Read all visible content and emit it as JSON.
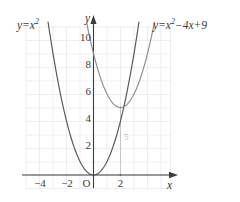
{
  "chart_data": {
    "type": "line",
    "title": "",
    "xlabel": "x",
    "ylabel": "y",
    "xlim": [
      -5.2,
      5.2
    ],
    "ylim": [
      -1.6,
      12.4
    ],
    "grid": true,
    "grid_step": 1,
    "legend": "inline-curve-labels",
    "x_ticks": [
      -4,
      -2,
      2
    ],
    "x_tick_labels": [
      "−4",
      "−2",
      "2"
    ],
    "y_ticks": [
      2,
      4,
      6,
      8,
      10
    ],
    "y_tick_labels": [
      "2",
      "4",
      "6",
      "8",
      "10"
    ],
    "origin_label": "O",
    "series": [
      {
        "name": "y=x^2",
        "label_text": "y=x²",
        "equation": "y = x^2",
        "color": "#555555",
        "vertex": [
          0,
          0
        ],
        "x": [
          -3.45,
          -3.0,
          -2.5,
          -2.0,
          -1.5,
          -1.0,
          -0.5,
          0.0,
          0.5,
          1.0,
          1.5,
          2.0,
          2.5,
          3.0,
          3.45
        ],
        "y": [
          11.9,
          9.0,
          6.25,
          4.0,
          2.25,
          1.0,
          0.25,
          0.0,
          0.25,
          1.0,
          2.25,
          4.0,
          6.25,
          9.0,
          11.9
        ]
      },
      {
        "name": "y=x^2-4x+9",
        "label_text": "y=x²−4x+9",
        "equation": "y = x^2 - 4x + 9",
        "color": "#8c8c8c",
        "vertex": [
          2,
          5
        ],
        "x": [
          -0.45,
          0.0,
          0.5,
          1.0,
          1.5,
          2.0,
          2.5,
          3.0,
          3.5,
          4.0,
          4.45
        ],
        "y": [
          11.0,
          9.0,
          7.25,
          6.0,
          5.25,
          5.0,
          5.25,
          6.0,
          7.25,
          9.0,
          11.0
        ]
      }
    ],
    "annotations": [
      {
        "name": "vertex-drop-line",
        "type": "vertical-segment",
        "x": 2,
        "y_from": 0,
        "y_to": 5,
        "label": "5",
        "color": "#b9b9b9"
      },
      {
        "name": "vertex-marker",
        "type": "point",
        "x": 2,
        "y": 5,
        "color": "#9a9a9a"
      },
      {
        "name": "foot-marker",
        "type": "point",
        "x": 2,
        "y": 0,
        "color": "#9a9a9a"
      }
    ]
  },
  "labels": {
    "left_curve": {
      "prefix": "y=x",
      "exponent": "2"
    },
    "right_curve": {
      "prefix": "y=x",
      "exponent": "2",
      "suffix": "−4x+9"
    },
    "axis_x": "x",
    "axis_y": "y",
    "origin": "O",
    "x_tick_minus4": "−4",
    "x_tick_minus2": "−2",
    "x_tick_2": "2",
    "y_tick_2": "2",
    "y_tick_4": "4",
    "y_tick_6": "6",
    "y_tick_8": "8",
    "y_tick_10": "10",
    "segment_length": "5"
  },
  "colors": {
    "background": "#ffffff",
    "grid": "#e8e4ea",
    "axis": "#3c3c3c",
    "curve_primary": "#555555",
    "curve_secondary": "#8c8c8c",
    "annotation": "#b9b9b9",
    "text": "#3c3c3c"
  }
}
